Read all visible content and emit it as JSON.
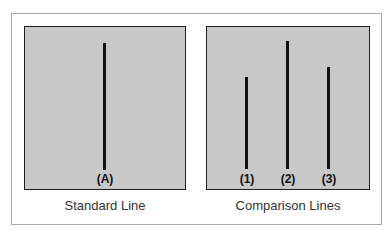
{
  "figure": {
    "standard": {
      "caption": "Standard Line",
      "line": {
        "label": "(A)",
        "x": 104,
        "top": 43,
        "bottom": 170
      }
    },
    "comparison": {
      "caption": "Comparison Lines",
      "lines": [
        {
          "label": "(1)",
          "x": 246,
          "top": 77,
          "bottom": 169
        },
        {
          "label": "(2)",
          "x": 287,
          "top": 41,
          "bottom": 169
        },
        {
          "label": "(3)",
          "x": 328,
          "top": 67,
          "bottom": 169
        }
      ]
    },
    "colors": {
      "panel": "#c8c8c8",
      "line": "#111111",
      "frame": "#a9a9a9"
    }
  }
}
